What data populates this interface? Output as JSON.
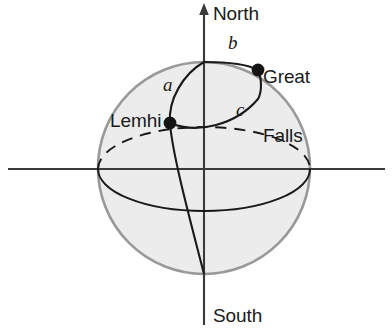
{
  "figure": {
    "kind": "sphere-spherical-triangle-diagram",
    "axes": {
      "north_label": "North",
      "south_label": "South",
      "vertical_axis_name": "polar-axis",
      "horizontal_axis_name": "equatorial-axis"
    },
    "points": [
      {
        "id": "lemhi",
        "label": "Lemhi",
        "x": 170,
        "y": 123
      },
      {
        "id": "great-falls",
        "label_line1": "Great",
        "label_line2": "Falls",
        "x": 258,
        "y": 70
      }
    ],
    "arc_labels": {
      "a": "a",
      "b": "b",
      "c": "c"
    },
    "colors": {
      "sphere_fill": "#ececec",
      "sphere_outline": "#999999",
      "curve": "#1a1a1a",
      "axis": "#3a3a3a",
      "text": "#1a1a1a",
      "background": "#ffffff"
    }
  }
}
